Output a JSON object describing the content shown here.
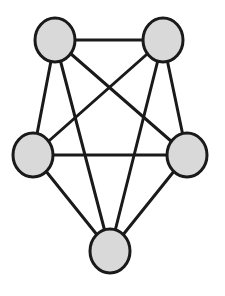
{
  "diagram": {
    "type": "graph",
    "style": {
      "node_fill": "#d9d9d9",
      "node_stroke": "#1a1a1a",
      "edge_stroke": "#1a1a1a",
      "node_stroke_width": 3,
      "edge_stroke_width": 3,
      "background": "#ffffff"
    },
    "nodes": [
      {
        "id": "top-left",
        "cx": 55,
        "cy": 40,
        "rx": 20,
        "ry": 22
      },
      {
        "id": "top-right",
        "cx": 163,
        "cy": 40,
        "rx": 20,
        "ry": 22
      },
      {
        "id": "mid-left",
        "cx": 33,
        "cy": 155,
        "rx": 20,
        "ry": 22
      },
      {
        "id": "mid-right",
        "cx": 187,
        "cy": 155,
        "rx": 20,
        "ry": 22
      },
      {
        "id": "bottom",
        "cx": 110,
        "cy": 251,
        "rx": 20,
        "ry": 22
      }
    ],
    "edges": [
      [
        "top-left",
        "top-right"
      ],
      [
        "top-left",
        "mid-left"
      ],
      [
        "top-left",
        "mid-right"
      ],
      [
        "top-left",
        "bottom"
      ],
      [
        "top-right",
        "mid-left"
      ],
      [
        "top-right",
        "mid-right"
      ],
      [
        "top-right",
        "bottom"
      ],
      [
        "mid-left",
        "mid-right"
      ],
      [
        "mid-left",
        "bottom"
      ],
      [
        "mid-right",
        "bottom"
      ]
    ]
  }
}
